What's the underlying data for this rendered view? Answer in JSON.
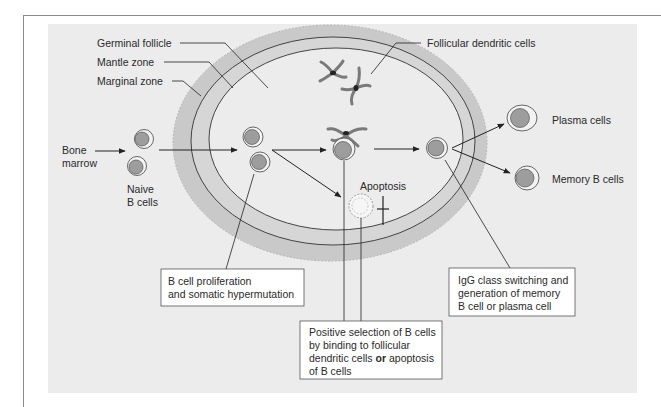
{
  "diagram": {
    "colors": {
      "panel": "#ececec",
      "marginal_zone": "#c9c9c9",
      "mantle_zone": "#d8d8d8",
      "germinal_follicle": "#ececec",
      "cell_nucleus": "#9a9a9a",
      "cell_body": "#efefef",
      "line": "#222222"
    },
    "zone_labels": {
      "germinal_follicle": "Germinal follicle",
      "mantle_zone": "Mantle zone",
      "marginal_zone": "Marginal zone",
      "follicular_dendritic_cells": "Follicular dendritic cells"
    },
    "input_labels": {
      "bone_marrow_line1": "Bone",
      "bone_marrow_line2": "marrow",
      "naive_line1": "Naive",
      "naive_line2": "B cells"
    },
    "output_labels": {
      "plasma_cells": "Plasma cells",
      "memory_b_cells": "Memory B cells",
      "apoptosis": "Apoptosis"
    },
    "callouts": {
      "proliferation": {
        "line1": "B cell proliferation",
        "line2": "and somatic hypermutation"
      },
      "selection": {
        "line1": "Positive selection of B cells",
        "line2": "by binding to follicular",
        "line3_a": "dendritic cells ",
        "line3_bold": "or",
        "line3_b": " apoptosis",
        "line4": "of B cells"
      },
      "class_switching": {
        "line1": "IgG class switching and",
        "line2": "generation of memory",
        "line3": "B cell or plasma cell"
      }
    }
  }
}
